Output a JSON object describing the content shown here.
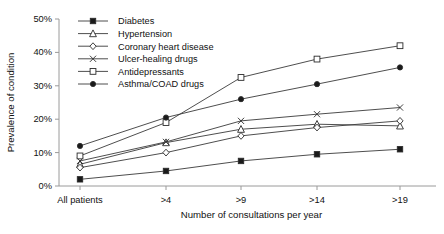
{
  "chart_data": {
    "type": "line",
    "title": "",
    "xlabel": "Number of consultations per year",
    "ylabel": "Prevalence of condition",
    "categories": [
      "All patients",
      ">4",
      ">9",
      ">14",
      ">19"
    ],
    "ylim": [
      0,
      50
    ],
    "yticks": [
      0,
      10,
      20,
      30,
      40,
      50
    ],
    "ytick_labels": [
      "0%",
      "10%",
      "20%",
      "30%",
      "40%",
      "50%"
    ],
    "grid": false,
    "legend_position": "top-center",
    "series": [
      {
        "name": "Diabetes",
        "marker": "filled-square",
        "values": [
          2.0,
          4.5,
          7.5,
          9.5,
          11.0
        ]
      },
      {
        "name": "Hypertension",
        "marker": "open-triangle",
        "values": [
          6.5,
          13.0,
          17.0,
          18.5,
          18.0
        ]
      },
      {
        "name": "Coronary heart disease",
        "marker": "open-diamond",
        "values": [
          5.5,
          10.0,
          15.0,
          17.5,
          19.5
        ]
      },
      {
        "name": "Ulcer-healing drugs",
        "marker": "cross-x",
        "values": [
          7.5,
          13.2,
          19.5,
          21.5,
          23.5
        ]
      },
      {
        "name": "Antidepressants",
        "marker": "open-square",
        "values": [
          9.0,
          19.0,
          32.5,
          38.0,
          42.0
        ]
      },
      {
        "name": "Asthma/COAD drugs",
        "marker": "filled-circle",
        "values": [
          12.0,
          20.5,
          26.0,
          30.5,
          35.5
        ]
      }
    ]
  },
  "colors": {
    "line": "#3a3a3a",
    "axis": "#9a9a9a",
    "text": "#111111",
    "background": "#ffffff"
  }
}
